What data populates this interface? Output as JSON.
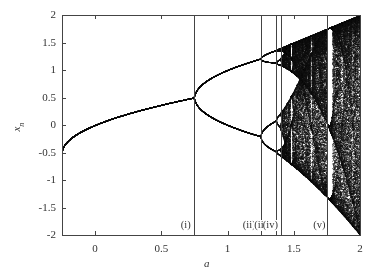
{
  "chart_data": {
    "type": "scatter",
    "title": "",
    "xlabel": "a",
    "ylabel": "x_n",
    "xlim": [
      -0.25,
      2
    ],
    "ylim": [
      -2,
      2
    ],
    "grid": false,
    "legend": null,
    "map": "x_{n+1} = a - x_n^2",
    "x_ticks": [
      {
        "value": 0,
        "label": "0"
      },
      {
        "value": 0.5,
        "label": "0.5"
      },
      {
        "value": 1,
        "label": "1"
      },
      {
        "value": 1.5,
        "label": "1.5"
      },
      {
        "value": 2,
        "label": "2"
      }
    ],
    "y_ticks": [
      {
        "value": 2,
        "label": "2"
      },
      {
        "value": 1.5,
        "label": "1.5"
      },
      {
        "value": 1,
        "label": "1"
      },
      {
        "value": 0.5,
        "label": "0.5"
      },
      {
        "value": 0,
        "label": "0"
      },
      {
        "value": -0.5,
        "label": "-0.5"
      },
      {
        "value": -1,
        "label": "-1"
      },
      {
        "value": -1.5,
        "label": "-1.5"
      },
      {
        "value": -2,
        "label": "-2"
      }
    ],
    "vertical_markers": [
      {
        "a": 0.75,
        "label": "(i)"
      },
      {
        "a": 1.25,
        "label": "(ii)"
      },
      {
        "a": 1.3681,
        "label": "(iii)"
      },
      {
        "a": 1.401,
        "label": "(iv)"
      },
      {
        "a": 1.75,
        "label": "(v)"
      }
    ],
    "series": [
      {
        "name": "period-1 fixed point",
        "a_range": [
          -0.25,
          0.75
        ],
        "formula": "x = (-1 + sqrt(1+4a))/2",
        "x": [
          -0.25,
          0,
          0.25,
          0.5,
          0.75
        ],
        "y": [
          -0.5,
          0,
          0.207,
          0.366,
          0.5
        ]
      },
      {
        "name": "period-2 orbit (upper)",
        "a_range": [
          0.75,
          1.25
        ],
        "x": [
          0.75,
          1.0,
          1.25
        ],
        "y": [
          0.5,
          1.0,
          1.207
        ]
      },
      {
        "name": "period-2 orbit (lower)",
        "a_range": [
          0.75,
          1.25
        ],
        "x": [
          0.75,
          1.0,
          1.25
        ],
        "y": [
          0.5,
          0.0,
          -0.207
        ]
      },
      {
        "name": "chaotic band envelope (max)",
        "x": [
          1.4,
          1.6,
          1.8,
          2.0
        ],
        "y": [
          1.4,
          1.6,
          1.8,
          2.0
        ]
      },
      {
        "name": "chaotic band envelope (min)",
        "x": [
          1.4,
          1.6,
          1.8,
          2.0
        ],
        "y": [
          -0.56,
          -0.96,
          -1.44,
          -2.0
        ]
      }
    ],
    "render": {
      "a_steps": 1400,
      "transient": 300,
      "samples": 140,
      "point_color": "#111111",
      "curve_color": "#555555",
      "frame_color": "#444444"
    }
  },
  "layout": {
    "plot_left": 62,
    "plot_right": 360,
    "plot_top": 15,
    "plot_bottom": 235
  }
}
